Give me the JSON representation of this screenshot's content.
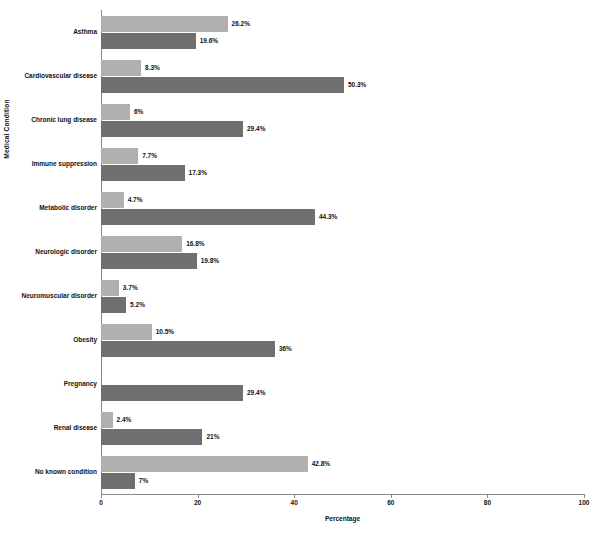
{
  "chart_data": {
    "type": "bar",
    "orientation": "horizontal",
    "title": "",
    "xlabel": "Percentage",
    "ylabel": "Medical Condition",
    "xlim": [
      0,
      100
    ],
    "xticks": [
      "0",
      "20",
      "40",
      "60",
      "80",
      "100"
    ],
    "grid": false,
    "legend": "none",
    "categories": [
      "Asthma",
      "Cardiovascular disease",
      "Chronic lung disease",
      "Immune suppression",
      "Metabolic disorder",
      "Neurologic disorder",
      "Neuromuscular disorder",
      "Obesity",
      "Pregnancy",
      "Renal disease",
      "No known condition"
    ],
    "series": [
      {
        "name": "series-light",
        "color": "#b0b0b0",
        "values": [
          26.2,
          8.3,
          6,
          7.7,
          4.7,
          16.8,
          3.7,
          10.5,
          0,
          2.4,
          42.8
        ],
        "labels": [
          "26.2%",
          "8.3%",
          "6%",
          "7.7%",
          "4.7%",
          "16.8%",
          "3.7%",
          "10.5%",
          "",
          "2.4%",
          "42.8%"
        ]
      },
      {
        "name": "series-dark",
        "color": "#6f6f6f",
        "values": [
          19.6,
          50.3,
          29.4,
          17.3,
          44.3,
          19.8,
          5.2,
          36,
          29.4,
          21,
          7
        ],
        "labels": [
          "19.6%",
          "50.3%",
          "29.4%",
          "17.3%",
          "44.3%",
          "19.8%",
          "5.2%",
          "36%",
          "29.4%",
          "21%",
          "7%"
        ]
      }
    ],
    "axis_color": "#8a8a8a",
    "background": "#ffffff"
  }
}
